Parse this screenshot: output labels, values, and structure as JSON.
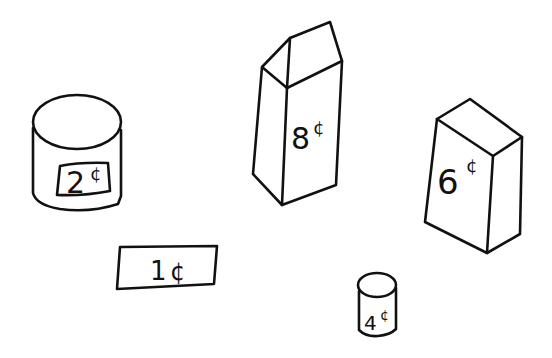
{
  "items": [
    {
      "id": "cylinder-large",
      "shape": "cylinder",
      "price": "2",
      "cents_sign": "¢",
      "label": "2¢"
    },
    {
      "id": "prism-tall",
      "shape": "pentagonal-prism",
      "price": "8",
      "cents_sign": "¢",
      "label": "8¢"
    },
    {
      "id": "box",
      "shape": "rectangular-prism",
      "price": "6",
      "cents_sign": "¢",
      "label": "6¢"
    },
    {
      "id": "rectangle",
      "shape": "rectangle",
      "price": "1",
      "cents_sign": "¢",
      "label": "1¢"
    },
    {
      "id": "cylinder-small",
      "shape": "cylinder",
      "price": "4",
      "cents_sign": "¢",
      "label": "4¢"
    }
  ],
  "colors": {
    "stroke": "#111111",
    "background": "#ffffff"
  }
}
